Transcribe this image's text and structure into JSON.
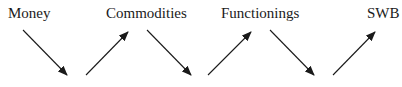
{
  "diagram": {
    "nodes": [
      {
        "id": "money",
        "label": "Money"
      },
      {
        "id": "commodities",
        "label": "Commodities"
      },
      {
        "id": "functionings",
        "label": "Functionings"
      },
      {
        "id": "swb",
        "label": "SWB"
      }
    ],
    "edges": [
      {
        "from": "money",
        "to": "commodities"
      },
      {
        "from": "commodities",
        "to": "functionings"
      },
      {
        "from": "functionings",
        "to": "swb"
      }
    ],
    "colors": {
      "text": "#1a1a1a",
      "arrow": "#1a1a1a"
    }
  }
}
